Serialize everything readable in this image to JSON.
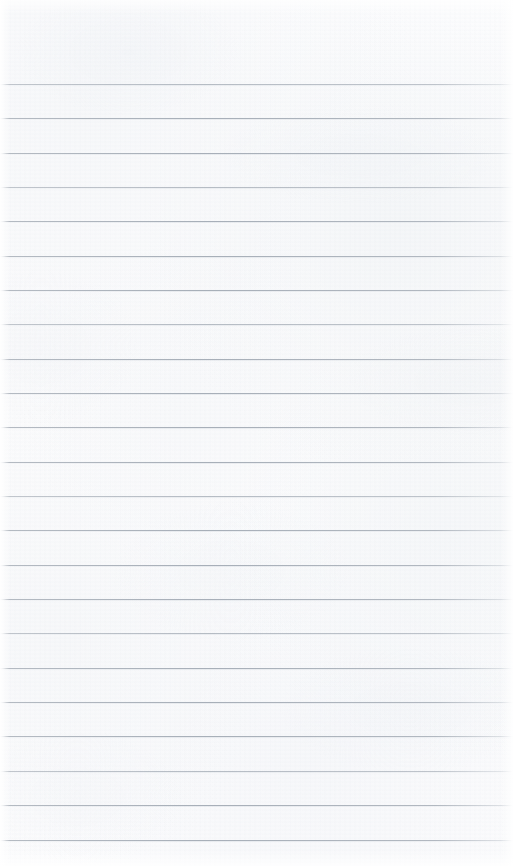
{
  "document": {
    "title": "Lined Paper Sheet",
    "kind": "blank-ruled-notepad-page",
    "width_px": 513,
    "height_px": 866,
    "text_content": "",
    "note": "No handwriting, printed text, headings, or marks are present on this page."
  },
  "paper": {
    "background_color": "#fbfbfc",
    "highlight_color": "#ffffff",
    "texture_tint": "#f2f4f7",
    "edge_margin_left_px": 2,
    "edge_margin_right_px": 6
  },
  "rules": {
    "line_color": "#a7aeb7",
    "line_thickness_px": 1,
    "spacing_px": 34.4,
    "first_line_y_px": 84,
    "last_line_y_px": 840,
    "count": 23,
    "y_positions": [
      84,
      118,
      153,
      187,
      221,
      256,
      290,
      324,
      359,
      393,
      427,
      462,
      496,
      530,
      565,
      599,
      633,
      668,
      702,
      736,
      771,
      805,
      840
    ],
    "faint_line_indices": [
      0,
      3,
      7,
      12,
      16,
      20
    ]
  }
}
